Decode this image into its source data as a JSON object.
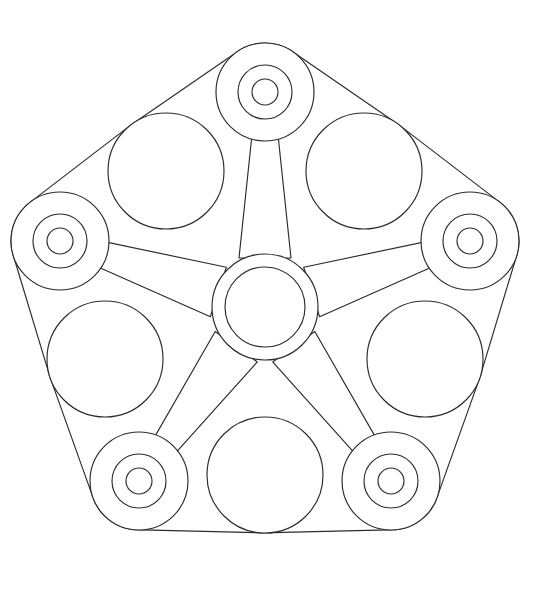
{
  "document": {
    "title": "Planetary Gear Carrier — Orthographic Line Drawing",
    "kind": "technical-line-drawing",
    "background_color": "#ffffff",
    "line_color": "#2b2b2b",
    "line_width": 1.15,
    "canvas": {
      "width": 533,
      "height": 615
    }
  },
  "geometry": {
    "center": {
      "x": 265,
      "y": 307
    },
    "outline": {
      "name": "outer-boundary",
      "description": "scalloped circular envelope formed by tangent arcs",
      "radius": 238
    },
    "hub": {
      "name": "central-hub",
      "cx": 265,
      "cy": 307,
      "outer_radius": 53,
      "inner_radius": 40
    },
    "arm": {
      "name": "tapered-spoke",
      "count": 5,
      "hub_half_width": 26,
      "boss_half_width": 11
    },
    "boss": {
      "name": "satellite-boss",
      "count": 5,
      "orbit_radius": 215,
      "outer_radius": 49,
      "mid_radius": 27,
      "inner_radius": 13,
      "angles_deg": [
        -90,
        -18,
        54,
        126,
        198
      ]
    },
    "planet": {
      "name": "planet-circle",
      "count": 5,
      "orbit_radius": 168,
      "radius": 58,
      "angles_deg": [
        -54,
        18,
        90,
        162,
        234
      ]
    }
  },
  "bosses": [
    {
      "id": "boss-top",
      "label": "Boss 1 (top)",
      "cx": 265,
      "cy": 92,
      "angle_deg": -90
    },
    {
      "id": "boss-upper-right",
      "label": "Boss 2 (upper right)",
      "cx": 470,
      "cy": 241,
      "angle_deg": -18
    },
    {
      "id": "boss-lower-right",
      "label": "Boss 3 (lower right)",
      "cx": 391,
      "cy": 481,
      "angle_deg": 54
    },
    {
      "id": "boss-lower-left",
      "label": "Boss 4 (lower left)",
      "cx": 139,
      "cy": 481,
      "angle_deg": 126
    },
    {
      "id": "boss-upper-left",
      "label": "Boss 5 (upper left)",
      "cx": 60,
      "cy": 241,
      "angle_deg": 198
    }
  ],
  "planets": [
    {
      "id": "planet-upper-right",
      "label": "Planet A (upper right)",
      "cx": 364,
      "cy": 171,
      "angle_deg": -54
    },
    {
      "id": "planet-right",
      "label": "Planet B (right)",
      "cx": 425,
      "cy": 359,
      "angle_deg": 18
    },
    {
      "id": "planet-bottom",
      "label": "Planet C (bottom)",
      "cx": 265,
      "cy": 475,
      "angle_deg": 90
    },
    {
      "id": "planet-left",
      "label": "Planet D (left)",
      "cx": 105,
      "cy": 359,
      "angle_deg": 162
    },
    {
      "id": "planet-upper-left",
      "label": "Planet E (upper left)",
      "cx": 166,
      "cy": 171,
      "angle_deg": 234
    }
  ],
  "accessibility": {
    "alt_text": "Black and white technical line drawing of a five-arm planetary gear carrier: a central concentric ring hub, five tapered spokes radiating outward to five concentric bosses, with five large plain circles interleaved between the bosses, all enclosed by a scalloped circular outline."
  }
}
